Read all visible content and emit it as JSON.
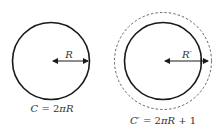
{
  "diagram": {
    "colors": {
      "stroke": "#1a1a1a",
      "dashed": "#555555",
      "text": "#333333",
      "background": "#ffffff"
    },
    "left": {
      "radius_label": "R",
      "caption": {
        "lhs": "C",
        "eq": " = 2",
        "pi": "π",
        "rhs": "R"
      },
      "caption_text": "C = 2πR"
    },
    "right": {
      "radius_label": "R′",
      "caption": {
        "lhs": "C′",
        "eq": " = 2",
        "pi": "π",
        "rhs": "R",
        "tail": " + 1"
      },
      "caption_text": "C′ = 2πR + 1",
      "outer_circle_style": "dashed"
    }
  }
}
